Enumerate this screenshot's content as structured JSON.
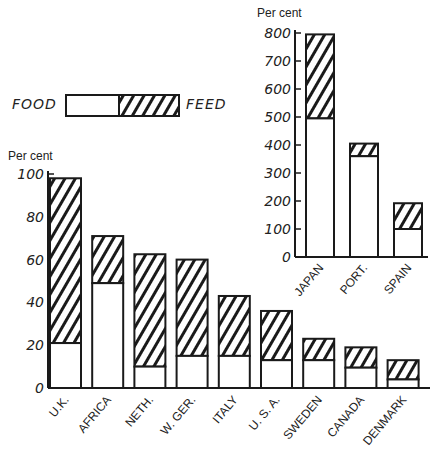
{
  "legend": {
    "food_label": "FOOD",
    "feed_label": "FEED"
  },
  "main_chart": {
    "unit_label": "Per cent",
    "ticks": [
      "0",
      "20",
      "40",
      "60",
      "80",
      "100"
    ]
  },
  "inset_chart": {
    "unit_label": "Per cent",
    "ticks": [
      "0",
      "100",
      "200",
      "300",
      "400",
      "500",
      "600",
      "700",
      "800"
    ]
  },
  "chart_data": [
    {
      "type": "bar",
      "stacked": true,
      "title": "",
      "xlabel": "",
      "ylabel": "Per cent",
      "ylim": [
        0,
        100
      ],
      "grid": false,
      "legend_position": "top-left",
      "categories": [
        "U.K.",
        "AFRICA",
        "NETH.",
        "W. GER.",
        "ITALY",
        "U. S. A.",
        "SWEDEN",
        "CANADA",
        "DENMARK"
      ],
      "series": [
        {
          "name": "FOOD",
          "pattern": "blank",
          "values": [
            21,
            49,
            10,
            15,
            15,
            13,
            13,
            9.5,
            4
          ]
        },
        {
          "name": "FEED",
          "pattern": "hatched",
          "values": [
            77,
            22,
            52.5,
            45,
            28,
            23,
            10,
            9.5,
            9
          ]
        }
      ],
      "totals": [
        98,
        71,
        62.5,
        60,
        43,
        36,
        23,
        19,
        13
      ]
    },
    {
      "type": "bar",
      "stacked": true,
      "title": "",
      "xlabel": "",
      "ylabel": "Per cent",
      "ylim": [
        0,
        800
      ],
      "grid": false,
      "categories": [
        "JAPAN",
        "PORT.",
        "SPAIN"
      ],
      "series": [
        {
          "name": "FOOD",
          "pattern": "blank",
          "values": [
            495,
            360,
            100
          ]
        },
        {
          "name": "FEED",
          "pattern": "hatched",
          "values": [
            300,
            45,
            92
          ]
        }
      ],
      "totals": [
        795,
        405,
        192
      ]
    }
  ]
}
